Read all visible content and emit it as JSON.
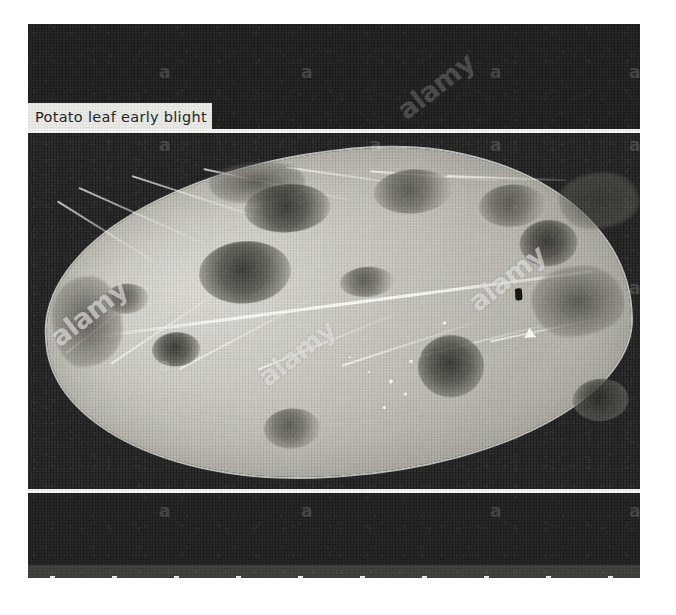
{
  "page": {
    "background_color": "#ffffff",
    "width": 676,
    "height": 615
  },
  "photo": {
    "frame_color": "#1d1d1d",
    "caption": {
      "text": "Potato leaf early blight",
      "background_color": "#e9e9e5",
      "text_color": "#1a1a1a"
    },
    "subject": "potato leaf with early blight lesions",
    "leaf_color": "#c7c5bd",
    "lesion_color": "#5c5a52",
    "separator_color": "#f2f2ee"
  },
  "watermarks": {
    "letter": "a",
    "word": "alamy",
    "letter_positions": [
      {
        "x": 131,
        "y": 40
      },
      {
        "x": 273,
        "y": 40
      },
      {
        "x": 462,
        "y": 40
      },
      {
        "x": 601,
        "y": 40
      },
      {
        "x": 131,
        "y": 113
      },
      {
        "x": 342,
        "y": 113
      },
      {
        "x": 462,
        "y": 113
      },
      {
        "x": 601,
        "y": 113
      },
      {
        "x": 131,
        "y": 333
      },
      {
        "x": 601,
        "y": 256
      },
      {
        "x": 131,
        "y": 479
      },
      {
        "x": 273,
        "y": 479
      },
      {
        "x": 462,
        "y": 479
      },
      {
        "x": 601,
        "y": 479
      },
      {
        "x": 131,
        "y": 552
      },
      {
        "x": 273,
        "y": 552
      },
      {
        "x": 462,
        "y": 552
      },
      {
        "x": 601,
        "y": 552
      }
    ],
    "word_positions": [
      {
        "x": 381,
        "y": 73,
        "on_light": false
      },
      {
        "x": 34,
        "y": 300,
        "on_light": true
      },
      {
        "x": 242,
        "y": 340,
        "on_light": true
      },
      {
        "x": 452,
        "y": 265,
        "on_light": true
      }
    ]
  },
  "leaf": {
    "veins": [
      {
        "x": 20,
        "y": 30,
        "w": 120,
        "rot": 36
      },
      {
        "x": 42,
        "y": 18,
        "w": 140,
        "rot": 28
      },
      {
        "x": 96,
        "y": 10,
        "w": 150,
        "rot": 22
      },
      {
        "x": 168,
        "y": 8,
        "w": 150,
        "rot": 16
      },
      {
        "x": 250,
        "y": 12,
        "w": 140,
        "rot": 12
      },
      {
        "x": 334,
        "y": 22,
        "w": 130,
        "rot": 8
      },
      {
        "x": 410,
        "y": 32,
        "w": 120,
        "rot": 6
      },
      {
        "x": 18,
        "y": 182,
        "w": 110,
        "rot": -34
      },
      {
        "x": 62,
        "y": 196,
        "w": 140,
        "rot": -30
      },
      {
        "x": 130,
        "y": 206,
        "w": 150,
        "rot": -24
      },
      {
        "x": 208,
        "y": 212,
        "w": 150,
        "rot": -18
      },
      {
        "x": 292,
        "y": 214,
        "w": 140,
        "rot": -14
      },
      {
        "x": 370,
        "y": 210,
        "w": 130,
        "rot": -10
      },
      {
        "x": 442,
        "y": 200,
        "w": 110,
        "rot": -8
      }
    ],
    "lesions": [
      {
        "x": 206,
        "y": 30,
        "w": 86,
        "h": 48,
        "dark": true
      },
      {
        "x": 336,
        "y": 24,
        "w": 78,
        "h": 44,
        "dark": false
      },
      {
        "x": 440,
        "y": 46,
        "w": 66,
        "h": 42,
        "dark": false
      },
      {
        "x": 156,
        "y": 84,
        "w": 92,
        "h": 62,
        "dark": true
      },
      {
        "x": 478,
        "y": 84,
        "w": 58,
        "h": 46,
        "dark": true
      },
      {
        "x": 104,
        "y": 170,
        "w": 48,
        "h": 34,
        "dark": true
      },
      {
        "x": 368,
        "y": 192,
        "w": 66,
        "h": 62,
        "dark": true
      },
      {
        "x": 210,
        "y": 254,
        "w": 56,
        "h": 40,
        "dark": false
      },
      {
        "x": 520,
        "y": 246,
        "w": 56,
        "h": 42,
        "dark": true
      },
      {
        "x": 296,
        "y": 118,
        "w": 54,
        "h": 30,
        "dark": false
      },
      {
        "x": 60,
        "y": 118,
        "w": 44,
        "h": 30,
        "dark": false
      }
    ],
    "blotches": [
      {
        "x": 172,
        "y": 6,
        "w": 96,
        "h": 40
      },
      {
        "x": 486,
        "y": 132,
        "w": 92,
        "h": 70
      },
      {
        "x": 6,
        "y": 108,
        "w": 70,
        "h": 90
      },
      {
        "x": 520,
        "y": 40,
        "w": 80,
        "h": 56
      }
    ],
    "specks": [
      {
        "x": 338,
        "y": 232,
        "d": 4
      },
      {
        "x": 352,
        "y": 246,
        "d": 3
      },
      {
        "x": 330,
        "y": 258,
        "d": 3
      },
      {
        "x": 360,
        "y": 214,
        "d": 3
      },
      {
        "x": 318,
        "y": 222,
        "d": 2
      },
      {
        "x": 300,
        "y": 206,
        "d": 2
      },
      {
        "x": 396,
        "y": 178,
        "d": 3
      }
    ],
    "fleck": {
      "x": 470,
      "y": 150,
      "w": 7,
      "h": 12
    },
    "marker": {
      "x": 476,
      "y": 190
    }
  }
}
